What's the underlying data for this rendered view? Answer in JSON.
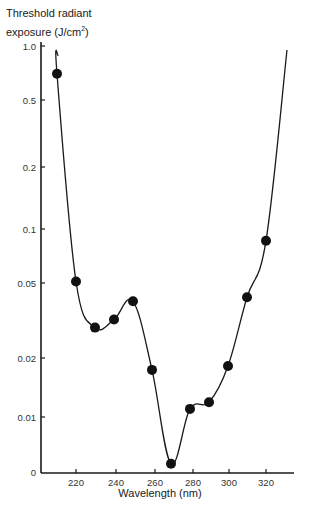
{
  "chart_data": {
    "type": "line",
    "title": "",
    "ylabel_line1": "Threshold radiant",
    "ylabel_line2_prefix": "exposure (J/cm",
    "ylabel_sup": "2",
    "ylabel_line2_suffix": ")",
    "xlabel": "Wavelength (nm)",
    "y_scale": "log-like (irregular, with 0 at origin)",
    "x_ticks": [
      220,
      240,
      260,
      280,
      300,
      320
    ],
    "y_ticks": [
      "1.0",
      "0.5",
      "0.2",
      "0.1",
      "0.05",
      "0.02",
      "0.01",
      "0"
    ],
    "xlim": [
      200,
      335
    ],
    "ylim": [
      0,
      1.0
    ],
    "grid": false,
    "legend": "none",
    "series": [
      {
        "name": "Threshold radiant exposure",
        "marker": "filled-circle",
        "x": [
          210,
          220,
          230,
          240,
          250,
          260,
          270,
          280,
          290,
          300,
          310,
          320
        ],
        "values": [
          0.7,
          0.051,
          0.029,
          0.032,
          0.04,
          0.0174,
          0.0015,
          0.011,
          0.0119,
          0.0182,
          0.042,
          0.086
        ]
      }
    ],
    "curve_extends": {
      "start": {
        "x": 210,
        "y": 1.0
      },
      "end": {
        "x": 330,
        "y": 1.0
      }
    }
  },
  "layout_map": {
    "x_px": {
      "220": 76,
      "240": 116,
      "260": 155,
      "280": 193,
      "300": 229,
      "320": 266
    },
    "y_px": {
      "1.0": 46,
      "0.5": 100,
      "0.2": 167,
      "0.1": 229,
      "0.05": 283,
      "0.02": 358,
      "0.01": 417,
      "0": 472
    }
  }
}
